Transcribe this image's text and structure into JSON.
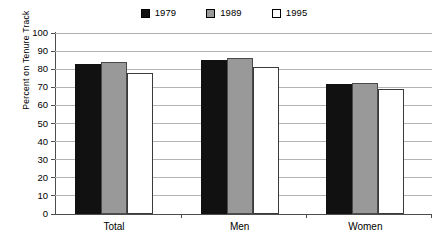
{
  "chart_data": {
    "type": "bar",
    "title": "",
    "xlabel": "",
    "ylabel": "Percent on Tenure Track",
    "categories": [
      "Total",
      "Men",
      "Women"
    ],
    "series": [
      {
        "name": "1979",
        "color": "#111111",
        "values": [
          83,
          85,
          72
        ]
      },
      {
        "name": "1989",
        "color": "#999999",
        "values": [
          84,
          86,
          72.5
        ]
      },
      {
        "name": "1995",
        "color": "#ffffff",
        "values": [
          78,
          81,
          69
        ]
      }
    ],
    "ylim": [
      0,
      100
    ],
    "ytick_step": 10,
    "yticks": [
      "100",
      "90",
      "80",
      "70",
      "60",
      "50",
      "40",
      "30",
      "20",
      "10",
      "0"
    ],
    "grid": "horizontal",
    "legend_position": "top-center"
  },
  "legend": {
    "items": [
      {
        "label": "1979",
        "swatch": "black-square-swatch"
      },
      {
        "label": "1989",
        "swatch": "gray-square-swatch"
      },
      {
        "label": "1995",
        "swatch": "white-square-swatch"
      }
    ]
  },
  "colors": {
    "series_1979": "#111111",
    "series_1989": "#999999",
    "series_1995": "#ffffff",
    "gridline": "#b4b4b4",
    "axis": "#4d4d4d"
  }
}
